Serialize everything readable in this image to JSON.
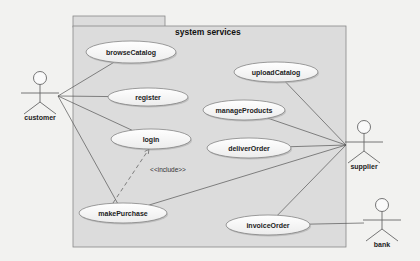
{
  "diagram": {
    "type": "uml-use-case",
    "package": {
      "title": "system services"
    },
    "actors": [
      {
        "id": "customer",
        "label": "customer",
        "x": 40,
        "y": 78
      },
      {
        "id": "supplier",
        "label": "supplier",
        "x": 364,
        "y": 127
      },
      {
        "id": "bank",
        "label": "bank",
        "x": 382,
        "y": 205
      }
    ],
    "use_cases": [
      {
        "id": "browseCatalog",
        "label": "browseCatalog",
        "cx": 131,
        "cy": 52,
        "rx": 45,
        "ry": 11
      },
      {
        "id": "register",
        "label": "register",
        "cx": 148,
        "cy": 97,
        "rx": 40,
        "ry": 9
      },
      {
        "id": "login",
        "label": "login",
        "cx": 151,
        "cy": 139,
        "rx": 40,
        "ry": 10
      },
      {
        "id": "makePurchase",
        "label": "makePurchase",
        "cx": 123,
        "cy": 213,
        "rx": 44,
        "ry": 10
      },
      {
        "id": "uploadCatalog",
        "label": "uploadCatalog",
        "cx": 276,
        "cy": 72,
        "rx": 42,
        "ry": 10
      },
      {
        "id": "manageProducts",
        "label": "manageProducts",
        "cx": 244,
        "cy": 110,
        "rx": 41,
        "ry": 10
      },
      {
        "id": "deliverOrder",
        "label": "deliverOrder",
        "cx": 249,
        "cy": 148,
        "rx": 42,
        "ry": 10
      },
      {
        "id": "invoiceOrder",
        "label": "invoiceOrder",
        "cx": 268,
        "cy": 225,
        "rx": 42,
        "ry": 10
      }
    ],
    "associations": [
      [
        "customer",
        "browseCatalog"
      ],
      [
        "customer",
        "register"
      ],
      [
        "customer",
        "login"
      ],
      [
        "customer",
        "makePurchase"
      ],
      [
        "supplier",
        "uploadCatalog"
      ],
      [
        "supplier",
        "manageProducts"
      ],
      [
        "supplier",
        "deliverOrder"
      ],
      [
        "supplier",
        "makePurchase"
      ],
      [
        "supplier",
        "invoiceOrder"
      ],
      [
        "bank",
        "invoiceOrder"
      ]
    ],
    "dependencies": [
      {
        "from": "makePurchase",
        "to": "login",
        "stereotype": "<<include>>"
      }
    ]
  }
}
